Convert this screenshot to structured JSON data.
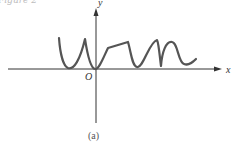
{
  "figure": {
    "caption": "Figure 2",
    "sublabel": "(a)"
  },
  "axes": {
    "x_label": "x",
    "y_label": "y",
    "origin_label": "O",
    "axis_color": "#333333",
    "curve_color": "#555555"
  }
}
